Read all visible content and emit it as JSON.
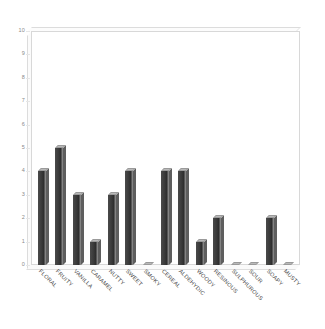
{
  "chart_data": {
    "type": "bar",
    "title": "",
    "subtitle": "",
    "xlabel": "",
    "ylabel": "",
    "ylim": [
      0,
      10
    ],
    "ytick_labels": [
      "0",
      "1",
      "2",
      "3",
      "4",
      "5",
      "6",
      "7",
      "8",
      "9",
      "10"
    ],
    "ytick_values": [
      0,
      1,
      2,
      3,
      4,
      5,
      6,
      7,
      8,
      9,
      10
    ],
    "grid": false,
    "legend": null,
    "legend_position": "none",
    "style": "3d-bar",
    "bar_color": "#3a3a3a",
    "bar_top_color": "#b9b9b9",
    "bar_edge_color": "#9a9a9a",
    "frame_color": "#d8d8d8",
    "background": "#ffffff",
    "tick_label_color": "#8a8a8a",
    "category_label_color": "#4a4a4a",
    "category_label_rotation": -45,
    "categories": [
      "FLORAL",
      "FRUITY",
      "VANILLA",
      "CARAMEL",
      "NUTTY",
      "SWEET",
      "SMOKY",
      "CEREAL",
      "ALDEHYDIC",
      "WOODY",
      "RESINOUS",
      "SULPHUROUS",
      "SOUR",
      "SOAPY",
      "MUSTY"
    ],
    "values": [
      4,
      5,
      3,
      1,
      3,
      4,
      0,
      4,
      4,
      1,
      2,
      0,
      0,
      2,
      0
    ]
  }
}
